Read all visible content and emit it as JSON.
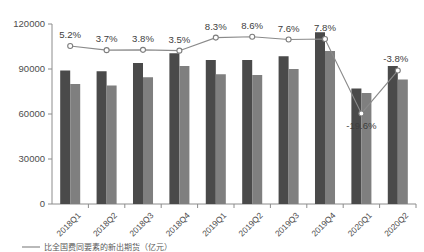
{
  "chart_data": {
    "type": "bar",
    "title": "",
    "subtitle": "",
    "xlabel": "",
    "ylabel": "",
    "ylim": [
      0,
      120000
    ],
    "y_ticks": [
      "0",
      "30000",
      "60000",
      "90000",
      "120000"
    ],
    "y_tick_values": [
      0,
      30000,
      60000,
      90000,
      120000
    ],
    "grid": false,
    "legend_position": "bottom",
    "categories": [
      "2018Q1",
      "2018Q2",
      "2018Q3",
      "2018Q4",
      "2019Q1",
      "2019Q2",
      "2019Q3",
      "2019Q4",
      "2020Q1",
      "2020Q2"
    ],
    "series": [
      {
        "name": "bar-dark",
        "type": "bar",
        "color": "#4a4a4a",
        "values": [
          89000,
          88500,
          94000,
          100500,
          96000,
          96000,
          98500,
          114500,
          77000,
          92000
        ]
      },
      {
        "name": "bar-light",
        "type": "bar",
        "color": "#7f7f7f",
        "values": [
          80000,
          79000,
          84500,
          92000,
          86500,
          86000,
          90000,
          102000,
          74000,
          83000
        ]
      },
      {
        "name": "growth-rate-line",
        "type": "line",
        "color": "#8a8a8a",
        "axis": "secondary",
        "values": [
          5.2,
          3.7,
          3.8,
          3.5,
          8.3,
          8.6,
          7.6,
          7.8,
          -19.6,
          -3.8
        ],
        "data_labels": [
          "5.2%",
          "3.7%",
          "3.8%",
          "3.5%",
          "8.3%",
          "8.6%",
          "7.6%",
          "7.8%",
          "-19.6%",
          "-3.8%"
        ]
      }
    ],
    "annotations": []
  },
  "caption": {
    "text": "比全国费同要素的新出期货（亿元）"
  }
}
